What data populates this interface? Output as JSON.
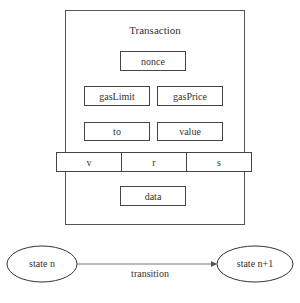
{
  "transaction": {
    "title": "Transaction",
    "fields": {
      "nonce": "nonce",
      "gasLimit": "gasLimit",
      "gasPrice": "gasPrice",
      "to": "to",
      "value": "value",
      "v": "v",
      "r": "r",
      "s": "s",
      "data": "data"
    }
  },
  "state_transition": {
    "from": "state n",
    "to": "state n+1",
    "edge_label": "transition"
  }
}
